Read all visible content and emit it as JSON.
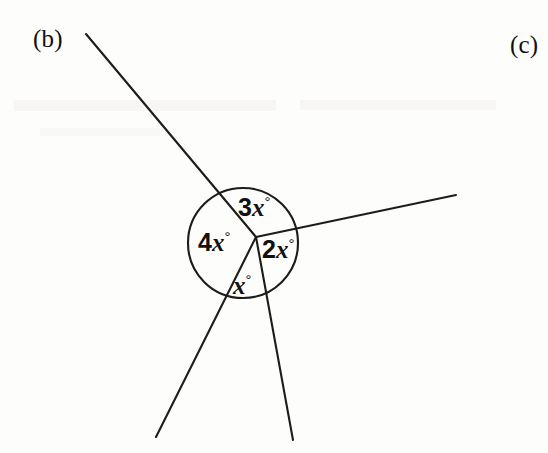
{
  "page": {
    "background_color": "#fdfdfc",
    "ink_color": "#1c1c1c",
    "width": 548,
    "height": 453
  },
  "part_labels": {
    "b": "(b)",
    "c": "(c)"
  },
  "diagram": {
    "name": "angles-at-a-point",
    "vertex": {
      "x": 256,
      "y": 237
    },
    "circle": {
      "cx": 243,
      "cy": 243,
      "r": 55
    },
    "rays": [
      {
        "name": "ray-upper-left",
        "x1": 256,
        "y1": 237,
        "x2": 86,
        "y2": 34
      },
      {
        "name": "ray-right",
        "x1": 256,
        "y1": 237,
        "x2": 456,
        "y2": 195
      },
      {
        "name": "ray-lower-left",
        "x1": 256,
        "y1": 237,
        "x2": 156,
        "y2": 437
      },
      {
        "name": "ray-lower-right",
        "x1": 256,
        "y1": 237,
        "x2": 293,
        "y2": 440
      }
    ],
    "angle_labels": [
      {
        "name": "angle-3x",
        "coefficient": "3",
        "variable": "x",
        "unit": "°",
        "text": "3x°"
      },
      {
        "name": "angle-4x",
        "coefficient": "4",
        "variable": "x",
        "unit": "°",
        "text": "4x°"
      },
      {
        "name": "angle-2x",
        "coefficient": "2",
        "variable": "x",
        "unit": "°",
        "text": "2x°"
      },
      {
        "name": "angle-x",
        "coefficient": "",
        "variable": "x",
        "unit": "°",
        "text": "x°"
      }
    ]
  }
}
